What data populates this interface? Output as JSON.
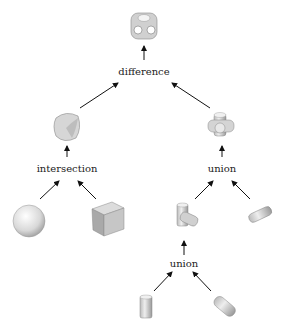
{
  "nodes": {
    "difference": {
      "label": "difference"
    },
    "intersection": {
      "label": "intersection"
    },
    "union_right": {
      "label": "union"
    },
    "union_bottom": {
      "label": "union"
    }
  },
  "shapes": [
    "difference-result-icon",
    "rounded-cube-icon",
    "cross-union-icon",
    "sphere-icon",
    "cube-icon",
    "two-cylinder-union-icon",
    "horizontal-cylinder-icon",
    "vertical-cylinder-icon",
    "tilted-cylinder-icon"
  ]
}
